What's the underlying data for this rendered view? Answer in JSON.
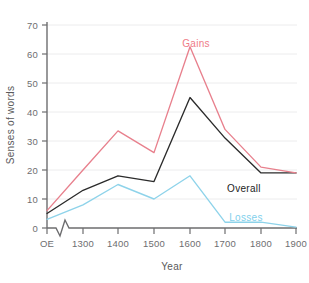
{
  "chart_data": {
    "type": "line",
    "title": "",
    "xlabel": "Year",
    "ylabel": "Senses of words",
    "x_tick_labels": [
      "OE",
      "1300",
      "1400",
      "1500",
      "1600",
      "1700",
      "1800",
      "1900"
    ],
    "y_tick_labels": [
      "0",
      "10",
      "20",
      "30",
      "40",
      "50",
      "60",
      "70"
    ],
    "y_ticks": [
      0,
      10,
      20,
      30,
      40,
      50,
      60,
      70
    ],
    "ylim": [
      0,
      73
    ],
    "grid": "horizontal",
    "legend_position": "inline-annotations",
    "axis_break": "x-axis break between OE and 1300",
    "categories": [
      "OE",
      "1300",
      "1400",
      "1500",
      "1600",
      "1700",
      "1800",
      "1900"
    ],
    "series": [
      {
        "name": "Gains",
        "color": "#e8808d",
        "values": [
          6,
          20,
          33.5,
          26,
          62.5,
          34,
          21,
          19
        ]
      },
      {
        "name": "Overall",
        "color": "#2b2b2b",
        "values": [
          5,
          13,
          18,
          16,
          45,
          31,
          19,
          19
        ]
      },
      {
        "name": "Losses",
        "color": "#8ed3ea",
        "values": [
          3,
          8,
          15,
          10,
          18,
          2,
          2,
          0.3
        ]
      }
    ],
    "annotations": [
      {
        "text": "Gains",
        "series": "Gains",
        "color": "#ef7b87"
      },
      {
        "text": "Overall",
        "series": "Overall",
        "color": "#232323"
      },
      {
        "text": "Losses",
        "series": "Losses",
        "color": "#7fd0ec"
      }
    ]
  },
  "axis": {
    "x_title": "Year",
    "y_title": "Senses of words"
  },
  "ticks": {
    "y": {
      "t70": "70",
      "t60": "60",
      "t50": "50",
      "t40": "40",
      "t30": "30",
      "t20": "20",
      "t10": "10",
      "t0": "0"
    },
    "x": {
      "oe": "OE",
      "y1300": "1300",
      "y1400": "1400",
      "y1500": "1500",
      "y1600": "1600",
      "y1700": "1700",
      "y1800": "1800",
      "y1900": "1900"
    }
  },
  "labels": {
    "gains": "Gains",
    "overall": "Overall",
    "losses": "Losses"
  }
}
